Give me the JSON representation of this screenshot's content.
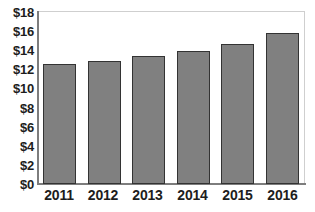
{
  "chart_data": {
    "type": "bar",
    "title": "",
    "subtitle": "",
    "xlabel": "",
    "ylabel": "",
    "categories": [
      "2011",
      "2012",
      "2013",
      "2014",
      "2015",
      "2016"
    ],
    "values": [
      12.6,
      12.9,
      13.4,
      13.9,
      14.7,
      15.8
    ],
    "series": [
      {
        "name": "",
        "values": [
          12.6,
          12.9,
          13.4,
          13.9,
          14.7,
          15.8
        ]
      }
    ],
    "ylim": [
      0,
      18
    ],
    "ytick_values": [
      0,
      2,
      4,
      6,
      8,
      10,
      12,
      14,
      16,
      18
    ],
    "ytick_labels": [
      "$0",
      "$2",
      "$4",
      "$6",
      "$8",
      "$10",
      "$12",
      "$14",
      "$16",
      "$18"
    ],
    "xtick_labels": [
      "2011",
      "2012",
      "2013",
      "2014",
      "2015",
      "2016"
    ],
    "grid": false,
    "legend": null,
    "legend_position": "none",
    "annotations": [],
    "colors": {
      "bar_fill": "#808080",
      "bar_border": "#333333",
      "axis": "#7d7d7d",
      "frame": "#c4c4c4",
      "text": "#1d1d1d",
      "background": "#ffffff"
    }
  }
}
